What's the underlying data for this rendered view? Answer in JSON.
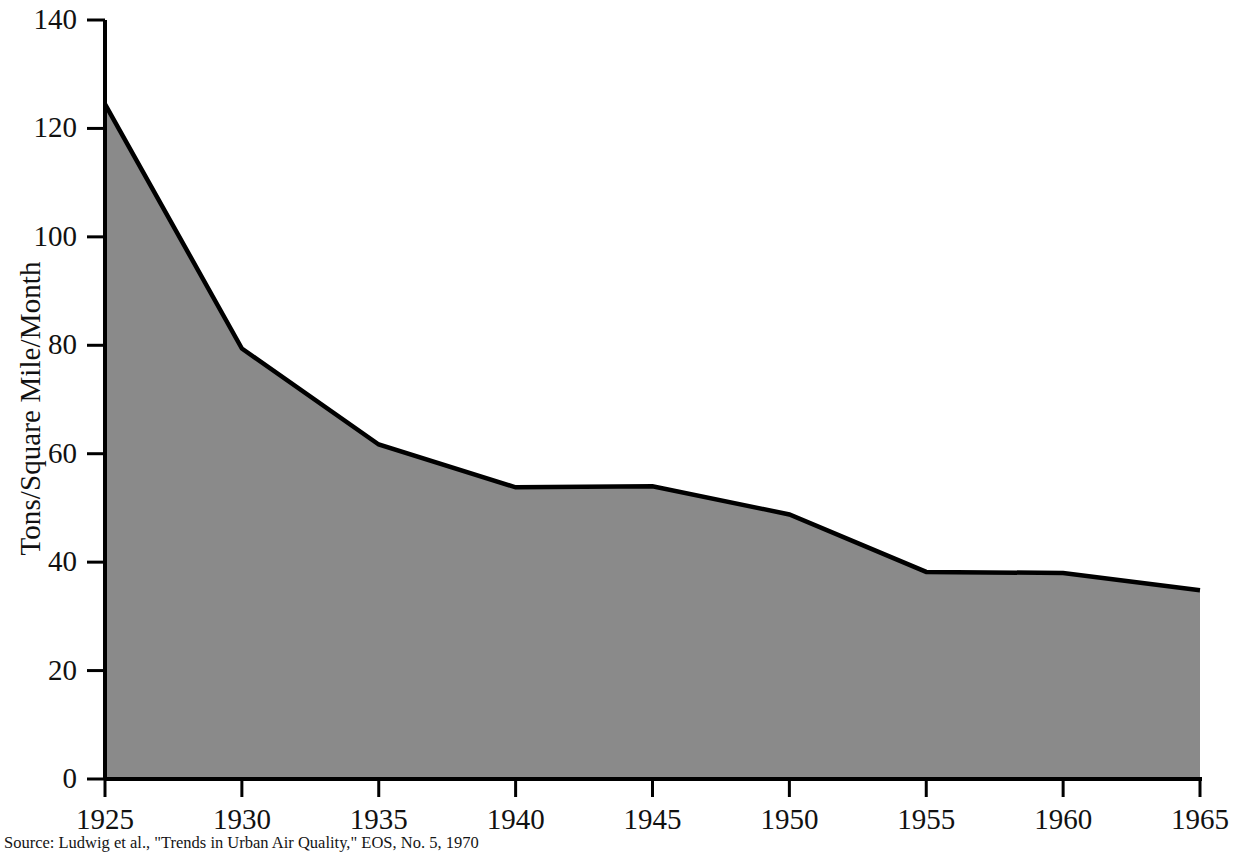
{
  "figure": {
    "source_note": "Source: Ludwig et al., \"Trends in Urban Air Quality,\" EOS, No. 5, 1970"
  },
  "axes": {
    "y_title": "Tons/Square Mile/Month",
    "y_ticks": [
      "0",
      "20",
      "40",
      "60",
      "80",
      "100",
      "120",
      "140"
    ],
    "x_ticks": [
      "1925",
      "1930",
      "1935",
      "1940",
      "1945",
      "1950",
      "1955",
      "1960",
      "1965"
    ]
  },
  "style": {
    "fill_color": "#8a8a8a",
    "line_color": "#000000",
    "axis_color": "#000000",
    "background": "#ffffff"
  },
  "chart_data": {
    "type": "area",
    "title": "",
    "xlabel": "",
    "ylabel": "Tons/Square Mile/Month",
    "x": [
      1925,
      1930,
      1935,
      1940,
      1945,
      1950,
      1955,
      1960,
      1965
    ],
    "values": [
      124.5,
      79.4,
      61.7,
      53.8,
      54.0,
      48.8,
      38.2,
      38.0,
      34.8
    ],
    "xlim": [
      1925,
      1965
    ],
    "ylim": [
      0,
      140
    ],
    "y_tick_values": [
      0,
      20,
      40,
      60,
      80,
      100,
      120,
      140
    ],
    "x_tick_values": [
      1925,
      1930,
      1935,
      1940,
      1945,
      1950,
      1955,
      1960,
      1965
    ],
    "grid": false,
    "legend": "none",
    "annotations": [
      "Source: Ludwig et al., \"Trends in Urban Air Quality,\" EOS, No. 5, 1970"
    ]
  }
}
